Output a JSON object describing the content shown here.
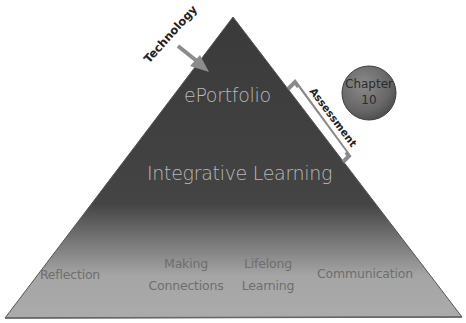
{
  "diagram": {
    "type": "pyramid",
    "apex": {
      "label": "ePortfolio"
    },
    "middle": {
      "label": "Integrative Learning"
    },
    "base": {
      "items": [
        {
          "label": "Reflection"
        },
        {
          "label_line1": "Making",
          "label_line2": "Connections"
        },
        {
          "label_line1": "Lifelong",
          "label_line2": "Learning"
        },
        {
          "label": "Communication"
        }
      ]
    },
    "annotations": {
      "arrow_label": "Technology",
      "bracket_label": "Assessment",
      "badge_line1": "Chapter",
      "badge_line2": "10"
    },
    "colors": {
      "pyramid_top": "#3b3b3b",
      "pyramid_bottom": "#a9a9a9",
      "arrow": "#8c8c8c",
      "bracket": "#8a8a8a",
      "badge": "#6f6f6f",
      "inner_text": "#b9b9b9",
      "base_text": "#6e6e6e"
    }
  }
}
